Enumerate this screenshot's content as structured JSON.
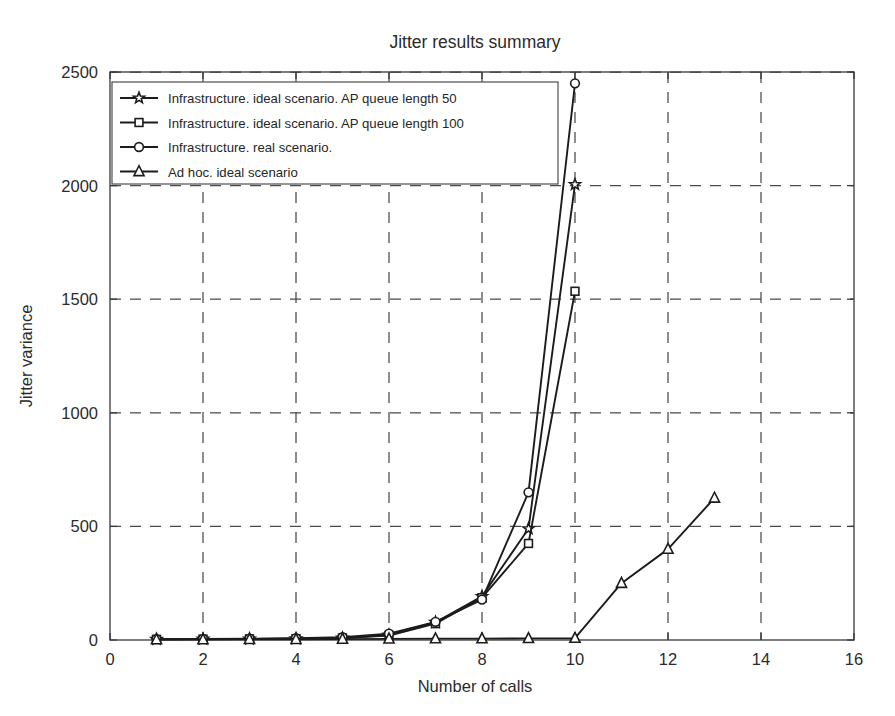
{
  "chart_data": {
    "type": "line",
    "title": "Jitter results summary",
    "xlabel": "Number of calls",
    "ylabel": "Jitter variance",
    "xlim": [
      0,
      16
    ],
    "ylim": [
      0,
      2500
    ],
    "xticks": [
      0,
      2,
      4,
      6,
      8,
      10,
      12,
      14,
      16
    ],
    "yticks": [
      0,
      500,
      1000,
      1500,
      2000,
      2500
    ],
    "xtick_labels": [
      "0",
      "2",
      "4",
      "6",
      "8",
      "10",
      "12",
      "14",
      "16"
    ],
    "ytick_labels": [
      "0",
      "500",
      "1000",
      "1500",
      "2000",
      "2500"
    ],
    "grid": true,
    "grid_style": "dashed",
    "legend_position": "upper-left-inside",
    "series": [
      {
        "name": "Infrastructure. ideal scenario. AP queue length 50",
        "marker": "pentagram-star",
        "x": [
          1,
          2,
          3,
          4,
          5,
          6,
          7,
          8,
          9,
          10
        ],
        "values": [
          3,
          4,
          5,
          6,
          9,
          22,
          78,
          192,
          490,
          2005
        ]
      },
      {
        "name": "Infrastructure. ideal scenario. AP queue length 100",
        "marker": "square",
        "x": [
          1,
          2,
          3,
          4,
          5,
          6,
          7,
          8,
          9,
          10
        ],
        "values": [
          3,
          4,
          5,
          6,
          9,
          20,
          72,
          186,
          425,
          1535
        ]
      },
      {
        "name": "Infrastructure. real scenario.",
        "marker": "circle",
        "x": [
          1,
          2,
          3,
          4,
          5,
          6,
          7,
          8,
          9,
          10
        ],
        "values": [
          4,
          5,
          6,
          8,
          12,
          28,
          80,
          178,
          650,
          2450
        ]
      },
      {
        "name": "Ad hoc. ideal scenario",
        "marker": "triangle",
        "x": [
          1,
          2,
          3,
          4,
          5,
          6,
          7,
          8,
          9,
          10,
          11,
          12,
          13
        ],
        "values": [
          2,
          2,
          3,
          3,
          4,
          5,
          6,
          6,
          7,
          8,
          250,
          400,
          625
        ]
      }
    ]
  },
  "legend": {
    "entries": [
      {
        "label": "Infrastructure. ideal scenario. AP queue length 50",
        "marker": "pentagram-star"
      },
      {
        "label": "Infrastructure. ideal scenario. AP queue length 100",
        "marker": "square"
      },
      {
        "label": "Infrastructure. real scenario.",
        "marker": "circle"
      },
      {
        "label": "Ad hoc. ideal scenario",
        "marker": "triangle"
      }
    ]
  },
  "colors": {
    "line": "#1c1c1c",
    "grid": "#4a4a4a",
    "axis": "#3a3a3a",
    "background": "#ffffff",
    "marker_fill": "#ffffff"
  }
}
